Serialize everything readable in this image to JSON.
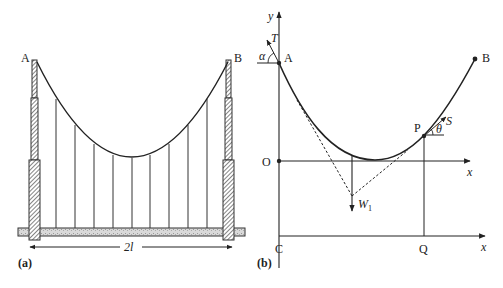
{
  "figure": {
    "panel_a": {
      "caption": "(a)",
      "point_left": "A",
      "point_right": "B",
      "span_label": "2l",
      "hanger_count": 9
    },
    "panel_b": {
      "caption": "(b)",
      "y_axis_label": "y",
      "x_axis_label_upper": "x",
      "x_axis_label_lower": "x",
      "origin_label": "O",
      "point_a": "A",
      "point_b": "B",
      "point_p": "P",
      "point_c": "C",
      "point_q": "Q",
      "tension_a": "T",
      "tension_p": "S",
      "angle_a": "α",
      "angle_p": "θ",
      "weight_label": "W",
      "weight_subscript": "1"
    }
  },
  "colors": {
    "line": "#222222",
    "hatch": "#333333",
    "road_fill": "#d8d8d8"
  }
}
